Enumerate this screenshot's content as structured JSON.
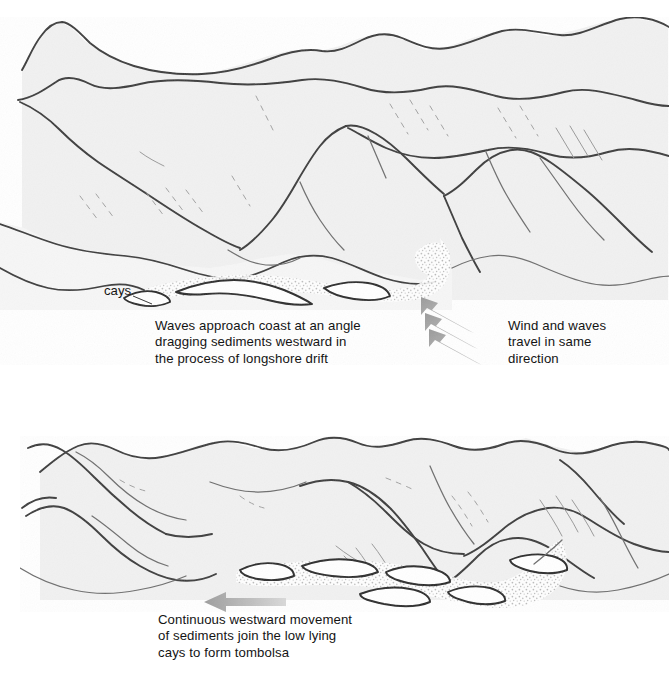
{
  "figure": {
    "type": "diagram",
    "panels": [
      {
        "id": "top",
        "stage": 1,
        "labels": [
          {
            "name": "cays",
            "text": "cays"
          }
        ],
        "captions": [
          {
            "name": "waves-caption",
            "text": "Waves approach coast at an angle\ndragging sediments westward in\nthe process of longshore drift"
          },
          {
            "name": "wind-caption",
            "text": "Wind and waves\ntravel in same\ndirection"
          }
        ],
        "arrows": [
          {
            "name": "wind-wave-arrow-1",
            "direction": "up-left",
            "color": "#a8a8a8"
          },
          {
            "name": "wind-wave-arrow-2",
            "direction": "up-left",
            "color": "#a8a8a8"
          },
          {
            "name": "wind-wave-arrow-3",
            "direction": "up-left",
            "color": "#a8a8a8"
          }
        ]
      },
      {
        "id": "bottom",
        "stage": 2,
        "labels": [],
        "captions": [
          {
            "name": "tombolo-caption",
            "text": "Continuous westward movement\nof sediments join the low lying\ncays to form tombolsa"
          }
        ],
        "arrows": [
          {
            "name": "westward-drift-arrow",
            "direction": "left",
            "color": "#a8a8a8"
          }
        ]
      }
    ],
    "colors": {
      "background": "#ffffff",
      "land_fill": "#f1f1f1",
      "ridge_line": "#3a3a3a",
      "sediment": "#cfcfcf",
      "arrow": "#a8a8a8",
      "text": "#141414"
    }
  }
}
